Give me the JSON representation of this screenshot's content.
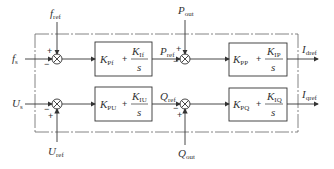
{
  "diagram": {
    "type": "control-block-diagram",
    "top_loop": {
      "input": {
        "main": "f",
        "sub": "s"
      },
      "reference": {
        "main": "f",
        "sub": "ref"
      },
      "junction1_signs": {
        "top": "+",
        "left": "−"
      },
      "block1": {
        "kp": {
          "main": "K",
          "sub": "Pf"
        },
        "ki": {
          "main": "K",
          "sub": "If"
        },
        "den": "s",
        "plus": "+"
      },
      "intermediate": {
        "main": "P",
        "sub": "ref"
      },
      "feedback": {
        "main": "P",
        "sub": "out"
      },
      "junction2_signs": {
        "top": "+",
        "left": "−"
      },
      "block2": {
        "kp": {
          "main": "K",
          "sub": "PP"
        },
        "ki": {
          "main": "K",
          "sub": "IP"
        },
        "den": "s",
        "plus": "+"
      },
      "output": {
        "main": "I",
        "sub": "dref"
      }
    },
    "bottom_loop": {
      "input": {
        "main": "U",
        "sub": "s"
      },
      "reference": {
        "main": "U",
        "sub": "ref"
      },
      "junction1_signs": {
        "bottom": "+",
        "left": "−"
      },
      "block1": {
        "kp": {
          "main": "K",
          "sub": "PU"
        },
        "ki": {
          "main": "K",
          "sub": "IU"
        },
        "den": "s",
        "plus": "+"
      },
      "intermediate": {
        "main": "Q",
        "sub": "ref"
      },
      "feedback": {
        "main": "Q",
        "sub": "out"
      },
      "junction2_signs": {
        "bottom": "+",
        "left": "−"
      },
      "block2": {
        "kp": {
          "main": "K",
          "sub": "PQ"
        },
        "ki": {
          "main": "K",
          "sub": "IQ"
        },
        "den": "s",
        "plus": "+"
      },
      "output": {
        "main": "I",
        "sub": "qref"
      }
    },
    "colors": {
      "line": "#333333",
      "dashed": "#666666"
    }
  }
}
